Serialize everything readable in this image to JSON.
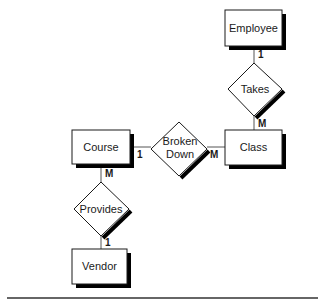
{
  "diagram": {
    "type": "entity-relationship",
    "entities": [
      {
        "id": "employee",
        "label": "Employee"
      },
      {
        "id": "class",
        "label": "Class"
      },
      {
        "id": "course",
        "label": "Course"
      },
      {
        "id": "vendor",
        "label": "Vendor"
      }
    ],
    "relationships": [
      {
        "id": "takes",
        "label": "Takes",
        "from": "employee",
        "to": "class",
        "from_card": "1",
        "to_card": "M"
      },
      {
        "id": "broken_down",
        "label_line1": "Broken",
        "label_line2": "Down",
        "from": "course",
        "to": "class",
        "from_card": "1",
        "to_card": "M"
      },
      {
        "id": "provides",
        "label": "Provides",
        "from": "course",
        "to": "vendor",
        "from_card": "M",
        "to_card": "1"
      }
    ],
    "colors": {
      "stroke": "#1a1a1a",
      "shadow": "#000000",
      "fill": "#ffffff",
      "connector": "#555555"
    }
  }
}
